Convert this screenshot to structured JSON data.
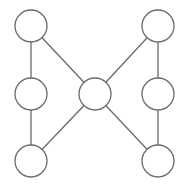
{
  "diagram": {
    "type": "graph",
    "canvas": {
      "width": 186,
      "height": 186,
      "background": "#ffffff"
    },
    "stroke_color": "#6a6a6a",
    "node_radius": 16,
    "nodes": [
      {
        "id": "top-left",
        "cx": 31,
        "cy": 26,
        "label": ""
      },
      {
        "id": "mid-left",
        "cx": 31,
        "cy": 94,
        "label": ""
      },
      {
        "id": "bottom-left",
        "cx": 31,
        "cy": 161,
        "label": ""
      },
      {
        "id": "center",
        "cx": 95,
        "cy": 94,
        "label": ""
      },
      {
        "id": "top-right",
        "cx": 158,
        "cy": 26,
        "label": ""
      },
      {
        "id": "mid-right",
        "cx": 158,
        "cy": 94,
        "label": ""
      },
      {
        "id": "bottom-right",
        "cx": 158,
        "cy": 161,
        "label": ""
      }
    ],
    "edges": [
      {
        "from": "top-left",
        "to": "mid-left"
      },
      {
        "from": "mid-left",
        "to": "bottom-left"
      },
      {
        "from": "top-left",
        "to": "center"
      },
      {
        "from": "bottom-left",
        "to": "center"
      },
      {
        "from": "top-right",
        "to": "center"
      },
      {
        "from": "bottom-right",
        "to": "center"
      },
      {
        "from": "top-right",
        "to": "mid-right"
      },
      {
        "from": "mid-right",
        "to": "bottom-right"
      }
    ]
  }
}
